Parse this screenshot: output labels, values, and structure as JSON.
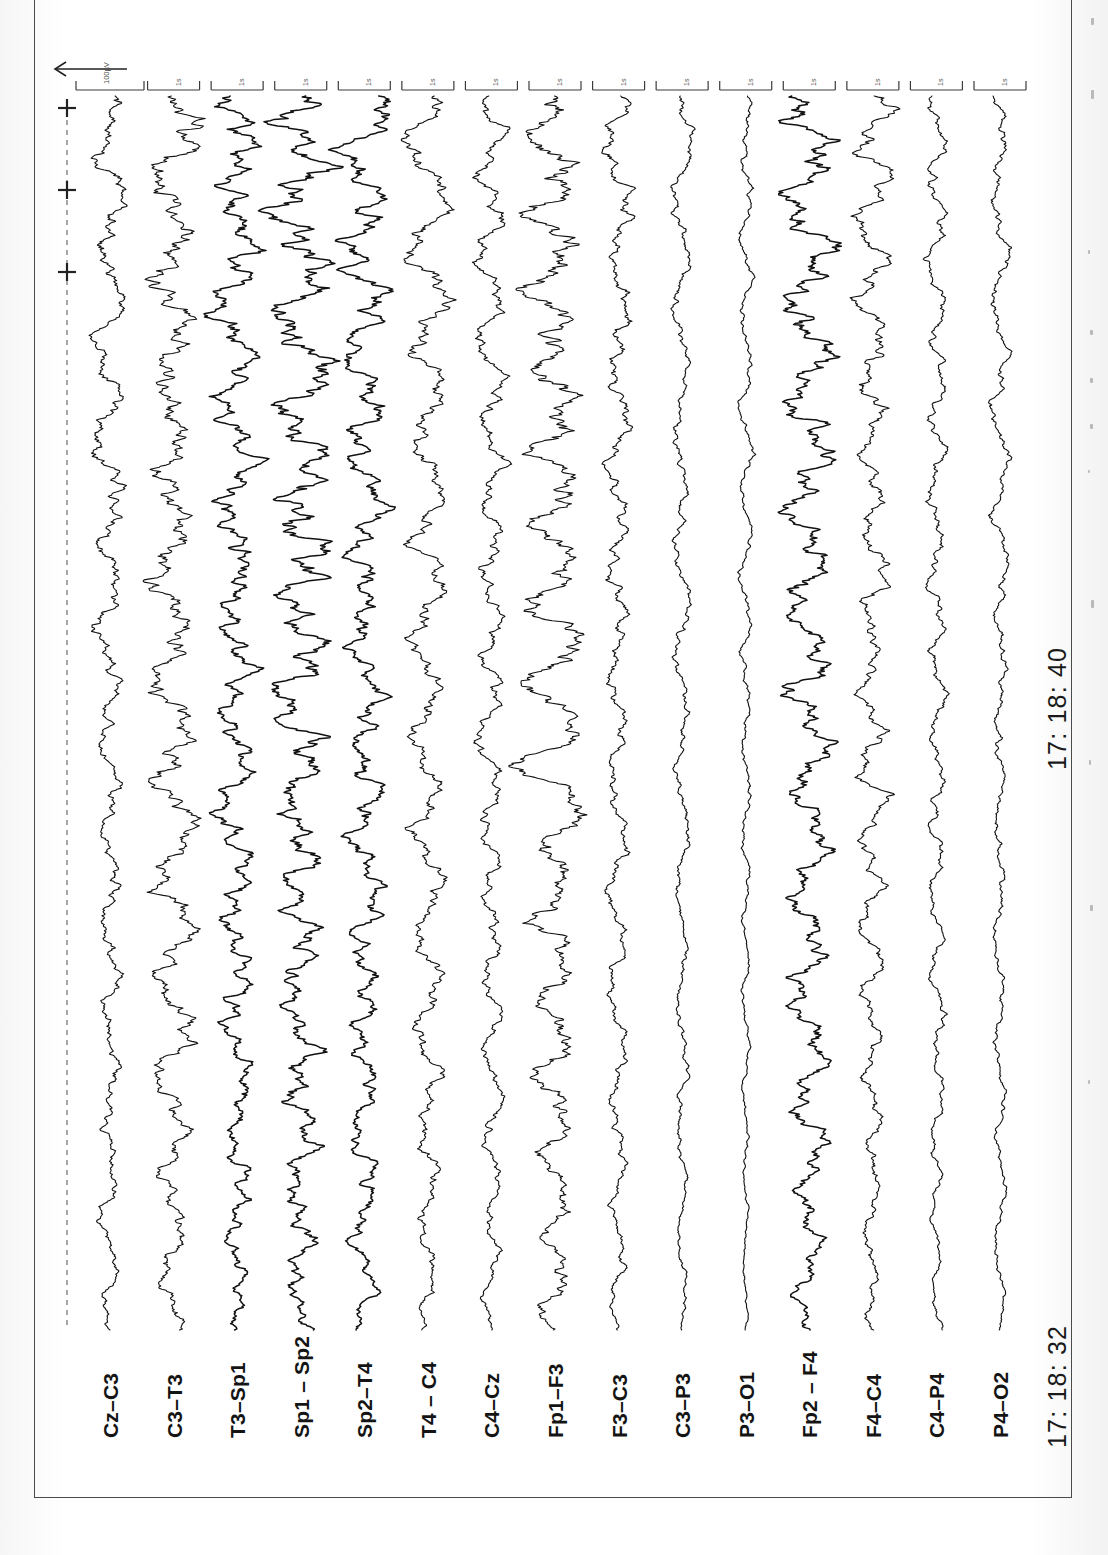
{
  "document": {
    "type": "EEG recording strip",
    "orientation": "landscape-rotated",
    "montage": "bipolar"
  },
  "timestamps": {
    "start": "17: 18: 32",
    "end": "17: 18: 40"
  },
  "scale": {
    "amplitude_label": "100µV",
    "time_label": "1s",
    "arrow_icon": "left-arrow-icon"
  },
  "chart_data": {
    "type": "line",
    "title": "",
    "subtitle": "",
    "xlabel": "",
    "ylabel": "",
    "grid": false,
    "legend_position": "left-rotated-labels",
    "orientation": "traces run vertically; time axis runs bottom-to-top",
    "time_axis": {
      "start_label": "17: 18: 32",
      "end_label": "17: 18: 40",
      "duration_seconds": 8,
      "tick_label": "1s",
      "tick_count": 3
    },
    "amplitude_axis": {
      "calibration_label": "100µV",
      "units": "µV"
    },
    "channel_count": 15,
    "series": [
      {
        "name": "Cz – C3",
        "label": "Cz–C3",
        "amplitude": 14,
        "roughness": 0.55,
        "seed": 11,
        "spike": null
      },
      {
        "name": "C3 – T3",
        "label": "C3–T3",
        "amplitude": 19,
        "roughness": 0.7,
        "seed": 23,
        "spike": null
      },
      {
        "name": "T3 – Sp1",
        "label": "T3–Sp1",
        "amplitude": 17,
        "roughness": 0.85,
        "seed": 37,
        "spike": null
      },
      {
        "name": "Sp1 – Sp2",
        "label": "Sp1 – Sp2",
        "amplitude": 21,
        "roughness": 0.95,
        "seed": 41,
        "spike": null
      },
      {
        "name": "Sp2 – T4",
        "label": "Sp2–T4",
        "amplitude": 18,
        "roughness": 0.8,
        "seed": 53,
        "spike": null
      },
      {
        "name": "T4 – C4",
        "label": "T4 – C4",
        "amplitude": 16,
        "roughness": 0.55,
        "seed": 67,
        "spike": null
      },
      {
        "name": "C4 – Cz",
        "label": "C4–Cz",
        "amplitude": 12,
        "roughness": 0.6,
        "seed": 71,
        "spike": null
      },
      {
        "name": "Fp1 – F3",
        "label": "Fp1–F3",
        "amplitude": 22,
        "roughness": 0.75,
        "seed": 83,
        "spike": {
          "at": 0.545,
          "size": -34,
          "width": 0.02
        }
      },
      {
        "name": "F3 – C3",
        "label": "F3–C3",
        "amplitude": 11,
        "roughness": 0.6,
        "seed": 97,
        "spike": {
          "at": 0.56,
          "size": 13,
          "width": 0.012
        }
      },
      {
        "name": "C3 – P3",
        "label": "C3–P3",
        "amplitude": 8,
        "roughness": 0.45,
        "seed": 103,
        "spike": null
      },
      {
        "name": "P3 – O1",
        "label": "P3–O1",
        "amplitude": 6,
        "roughness": 0.35,
        "seed": 113,
        "spike": null
      },
      {
        "name": "Fp2 – F4",
        "label": "Fp2 – F4",
        "amplitude": 20,
        "roughness": 0.85,
        "seed": 131,
        "spike": {
          "at": 0.553,
          "size": -26,
          "width": 0.016
        }
      },
      {
        "name": "F4 – C4",
        "label": "F4–C4",
        "amplitude": 13,
        "roughness": 0.65,
        "seed": 149,
        "spike": {
          "at": 0.565,
          "size": 15,
          "width": 0.011
        }
      },
      {
        "name": "C4 – P4",
        "label": "C4–P4",
        "amplitude": 9,
        "roughness": 0.5,
        "seed": 157,
        "spike": null
      },
      {
        "name": "P4 – O2",
        "label": "P4–O2",
        "amplitude": 8,
        "roughness": 0.4,
        "seed": 173,
        "spike": null
      }
    ],
    "colors": {
      "trace": "#111111",
      "axis": "#555555",
      "background": "#ffffff"
    }
  }
}
